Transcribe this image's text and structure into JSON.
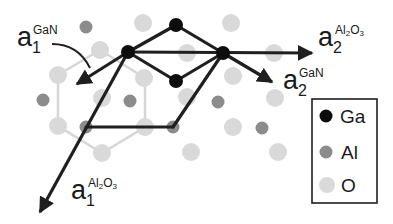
{
  "colors": {
    "ga": "#0d0d0d",
    "al": "#8c8c8c",
    "o": "#d9d9d9",
    "bond_dark": "#1f1f1f",
    "bond_light": "#d6d6d6",
    "text": "#1a1a1a"
  },
  "atoms": {
    "ga": [
      [
        176,
        25
      ],
      [
        128,
        52
      ],
      [
        223,
        53
      ],
      [
        176,
        81
      ]
    ],
    "al": [
      [
        86,
        27
      ],
      [
        43,
        100
      ],
      [
        130,
        101
      ],
      [
        218,
        102
      ],
      [
        86,
        127
      ],
      [
        173,
        127
      ],
      [
        262,
        128
      ]
    ],
    "o": [
      [
        143,
        23
      ],
      [
        231,
        23
      ],
      [
        100,
        50
      ],
      [
        187,
        53
      ],
      [
        274,
        53
      ],
      [
        58,
        75
      ],
      [
        144,
        78
      ],
      [
        233,
        76
      ],
      [
        102,
        98
      ],
      [
        187,
        97
      ],
      [
        275,
        98
      ],
      [
        58,
        126
      ],
      [
        145,
        127
      ],
      [
        233,
        127
      ],
      [
        102,
        153
      ],
      [
        191,
        152
      ],
      [
        278,
        152
      ]
    ]
  },
  "labels": {
    "a1_gan": {
      "base": "a",
      "index": "1",
      "superscript": "GaN"
    },
    "a2_al2o3": {
      "base": "a",
      "index": "2",
      "superscript_parts": [
        "Al",
        "2",
        "O",
        "3"
      ]
    },
    "a2_gan": {
      "base": "a",
      "index": "2",
      "superscript": "GaN"
    },
    "a1_al2o3": {
      "base": "a",
      "index": "1",
      "superscript_parts": [
        "Al",
        "2",
        "O",
        "3"
      ]
    }
  },
  "legend": {
    "items": [
      {
        "label": "Ga",
        "color": "#0d0d0d"
      },
      {
        "label": "Al",
        "color": "#8c8c8c"
      },
      {
        "label": "O",
        "color": "#d9d9d9"
      }
    ]
  }
}
